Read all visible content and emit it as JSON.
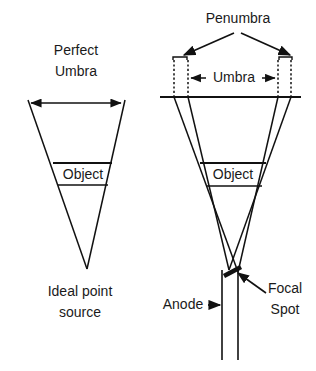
{
  "figure": {
    "background_color": "#ffffff",
    "line_color": "#111111",
    "text_color": "#1a1a1a"
  },
  "left_panel": {
    "name": "ideal-point-source-diagram",
    "labels": {
      "perfect": "Perfect",
      "umbra": "Umbra",
      "object": "Object",
      "source_line1": "Ideal point",
      "source_line2": "source"
    },
    "geometry": {
      "cone_apex": [
        87,
        269
      ],
      "cone_top_left": [
        28,
        100
      ],
      "cone_top_right": [
        125,
        100
      ],
      "object_top_y": 163,
      "object_bottom_y": 185,
      "umbra_arrow_y": 103,
      "umbra_arrow_x1": 31,
      "umbra_arrow_x2": 121
    }
  },
  "right_panel": {
    "name": "focal-spot-diagram",
    "labels": {
      "penumbra": "Penumbra",
      "umbra": "Umbra",
      "object": "Object",
      "anode": "Anode",
      "focal_line1": "Focal",
      "focal_line2": "Spot"
    },
    "geometry": {
      "film_plane_y": 97,
      "film_plane_x1": 160,
      "film_plane_x2": 301,
      "penumbra_left_bracket_x": [
        173,
        187
      ],
      "penumbra_right_bracket_x": [
        279,
        292
      ],
      "bracket_y": 57,
      "umbra_arrow_y": 78,
      "umbra_arrow_x1": 189,
      "umbra_arrow_x2": 277,
      "object_top_y": 163,
      "object_bottom_y": 186,
      "focal_spot_point": [
        238,
        272
      ],
      "anode_x1": 222,
      "anode_x2": 238,
      "anode_bottom_y": 360
    }
  },
  "annotations": {
    "penumbra_arrow_origin": [
      237,
      34
    ],
    "anode_arrow_from_x": 196,
    "anode_arrow_to_x": 219,
    "anode_arrow_y": 305,
    "focal_leader_from": [
      267,
      292
    ],
    "focal_leader_to": [
      243,
      274
    ]
  }
}
